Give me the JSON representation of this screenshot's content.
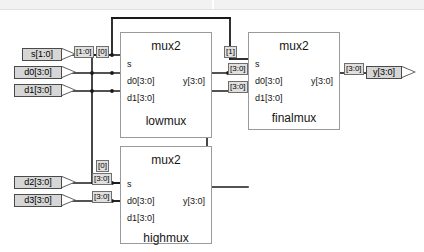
{
  "diagram": {
    "colors": {
      "wire": "#1a1a1a",
      "box_border": "#9a9a9a",
      "pin_fill": "#d6d6d6",
      "label_fill": "#e0e0e0",
      "banner": "#f2f2f2",
      "background": "#ffffff"
    }
  },
  "inputs": [
    {
      "name": "pin-s",
      "label": "s[1:0]"
    },
    {
      "name": "pin-d0",
      "label": "d0[3:0]"
    },
    {
      "name": "pin-d1",
      "label": "d1[3:0]"
    },
    {
      "name": "pin-d2",
      "label": "d2[3:0]"
    },
    {
      "name": "pin-d3",
      "label": "d3[3:0]"
    }
  ],
  "outputs": [
    {
      "name": "pin-y",
      "label": "y[3:0]"
    }
  ],
  "blocks": [
    {
      "type": "mux2",
      "instance": "lowmux",
      "ports_in": [
        "s",
        "d0[3:0]",
        "d1[3:0]"
      ],
      "port_out": "y[3:0]"
    },
    {
      "type": "mux2",
      "instance": "finalmux",
      "ports_in": [
        "s",
        "d0[3:0]",
        "d1[3:0]"
      ],
      "port_out": "y[3:0]"
    },
    {
      "type": "mux2",
      "instance": "highmux",
      "ports_in": [
        "s",
        "d0[3:0]",
        "d1[3:0]"
      ],
      "port_out": "y[3:0]"
    }
  ],
  "net_labels": {
    "s_bus": "[1:0]",
    "s_bit0_lowmux": "[0]",
    "s_bit0_highmux": "[0]",
    "s_bit1_finalmux": "[1]",
    "lowmux_y": "[3:0]",
    "highmux_y": "[3:0]",
    "finalmux_d0": "[3:0]",
    "finalmux_d1": "[3:0]",
    "finalmux_y": "[3:0]",
    "d2_bus": "[3:0]",
    "d3_bus": "[3:0]"
  }
}
